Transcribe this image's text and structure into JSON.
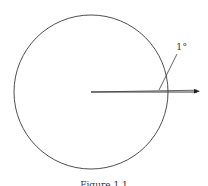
{
  "figure": {
    "angle_label": "1°",
    "caption": "Figure 1.1",
    "colors": {
      "stroke": "#3a3a3a",
      "background": "#ffffff"
    }
  }
}
